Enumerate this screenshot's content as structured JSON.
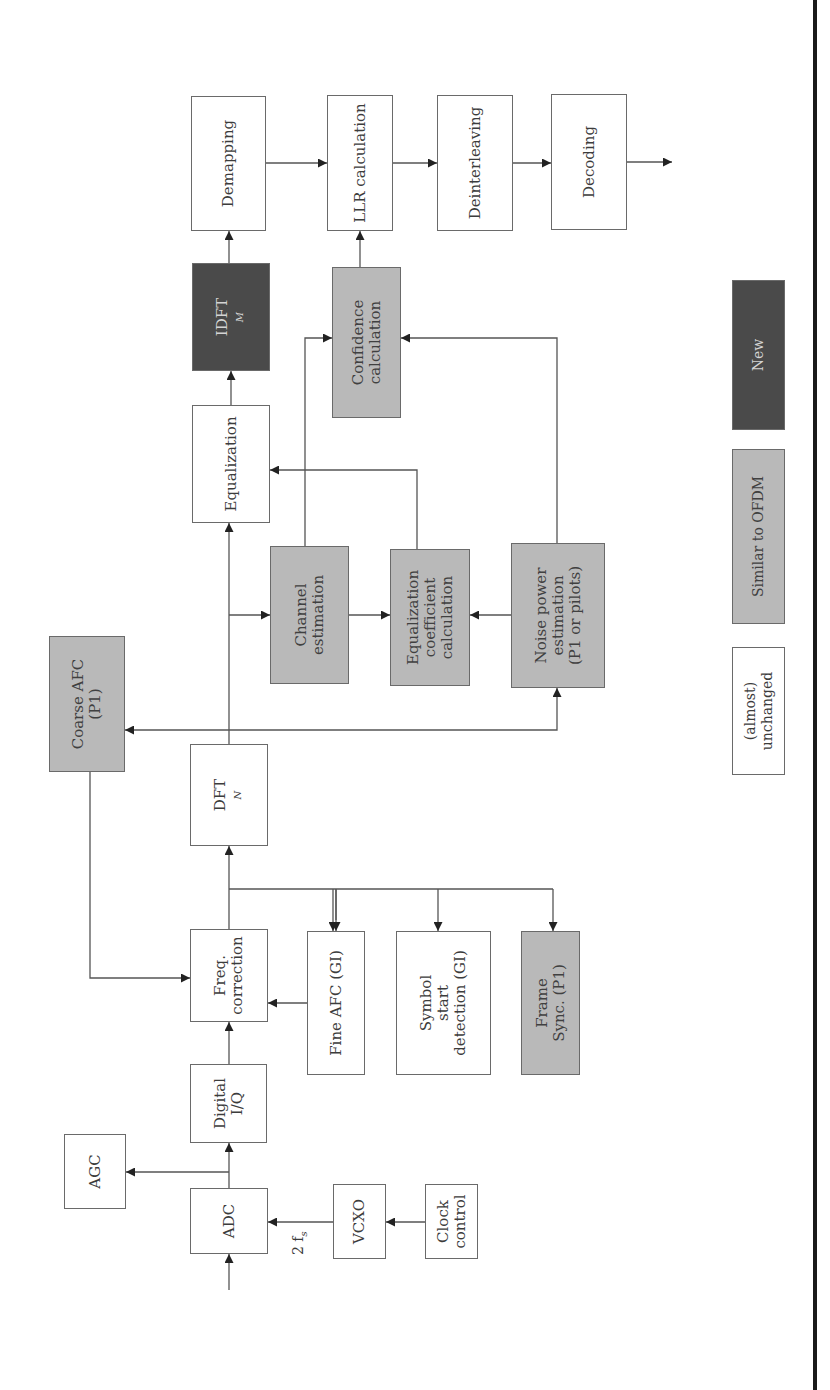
{
  "diagram": {
    "orientation": "rotated-90-ccw",
    "colors": {
      "unchanged_fill": "#ffffff",
      "similar_fill": "#b9b9b9",
      "new_fill": "#4a4a4a",
      "border": "#6a6a6a",
      "frame_rule": "#1a1a1a"
    },
    "blocks": {
      "adc": "ADC",
      "agc": "AGC",
      "digital_iq": [
        "Digital",
        "I/Q"
      ],
      "vcxo": "VCXO",
      "clock_control": [
        "Clock",
        "control"
      ],
      "freq_correction": [
        "Freq.",
        "correction"
      ],
      "fine_afc": "Fine AFC (GI)",
      "symbol_start": [
        "Symbol",
        "start",
        "detection (GI)"
      ],
      "frame_sync": [
        "Frame",
        "Sync. (P1)"
      ],
      "dft": {
        "base": "DFT",
        "sub": "N"
      },
      "coarse_afc": [
        "Coarse AFC",
        "(P1)"
      ],
      "channel_estimation": [
        "Channel",
        "estimation"
      ],
      "eq_coeff": [
        "Equalization",
        "coefficient",
        "calculation"
      ],
      "noise_power": [
        "Noise power",
        "estimation",
        "(P1 or pilots)"
      ],
      "equalization": "Equalization",
      "confidence": [
        "Confidence",
        "calculation"
      ],
      "idft": {
        "base": "IDFT",
        "sub": "M"
      },
      "demapping": "Demapping",
      "llr": "LLR calculation",
      "deinterleaving": "Deinterleaving",
      "decoding": "Decoding"
    },
    "labels": {
      "clock_rate": "2 f",
      "clock_rate_sub": "s"
    },
    "legend": {
      "unchanged": "(almost) unchanged",
      "similar": "Similar to OFDM",
      "new": "New"
    }
  }
}
